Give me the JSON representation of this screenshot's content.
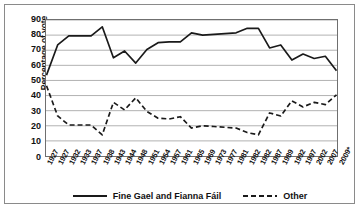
{
  "chart_data": {
    "type": "line",
    "title": "",
    "xlabel": "",
    "ylabel": "Percentage of vote",
    "ylim": [
      0,
      90
    ],
    "ytick_step": 10,
    "yticks": [
      90,
      80,
      70,
      60,
      50,
      40,
      30,
      20,
      10,
      0
    ],
    "grid": true,
    "legend_position": "bottom",
    "categories": [
      "1927",
      "1927",
      "1932",
      "1933",
      "1937",
      "1938",
      "1943",
      "1944",
      "1948",
      "1951",
      "1954",
      "1957",
      "1961",
      "1965",
      "1969",
      "1973",
      "1977",
      "1981",
      "1982",
      "1982",
      "1987",
      "1989",
      "1992",
      "1997",
      "2002",
      "2007",
      "2009*"
    ],
    "series": [
      {
        "name": "Fine Gael and Fianna Fáil",
        "style": "solid",
        "color": "#1a1a1a",
        "values": [
          53.5,
          73.5,
          79.5,
          79.5,
          79.5,
          85.5,
          65,
          69.5,
          61.5,
          70.5,
          75,
          75.5,
          75.5,
          81.5,
          80,
          80.5,
          81,
          81.5,
          84.5,
          84.5,
          71.5,
          73.5,
          63.5,
          67.5,
          64.5,
          66,
          56.5
        ]
      },
      {
        "name": "Other",
        "style": "dashed",
        "color": "#1a1a1a",
        "values": [
          46.5,
          26.5,
          20.5,
          20.5,
          20.5,
          14,
          35.5,
          30.5,
          38.5,
          29.5,
          25,
          24.5,
          26,
          18.5,
          20,
          19.5,
          19,
          18.5,
          15.5,
          14,
          28.5,
          26.5,
          36.5,
          32.5,
          35.5,
          34,
          40.5
        ]
      }
    ]
  },
  "axis": {
    "y_title": "Percentage of vote"
  },
  "legend": {
    "items": [
      {
        "label": "Fine Gael and Fianna Fáil",
        "style": "solid"
      },
      {
        "label": "Other",
        "style": "dashed"
      }
    ]
  }
}
